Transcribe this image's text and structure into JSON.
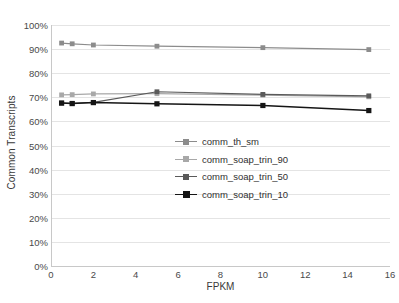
{
  "chart_data": {
    "type": "line",
    "title": "",
    "xlabel": "FPKM",
    "ylabel": "Common Transcripts",
    "xlim": [
      0,
      16
    ],
    "ylim": [
      0,
      100
    ],
    "grid": true,
    "legend_position": "center-inside",
    "x": [
      0.5,
      1,
      2,
      5,
      10,
      15
    ],
    "xticks": [
      "0",
      "2",
      "4",
      "6",
      "8",
      "10",
      "12",
      "14",
      "16"
    ],
    "xtick_values": [
      0,
      2,
      4,
      6,
      8,
      10,
      12,
      14,
      16
    ],
    "yticks": [
      "0%",
      "10%",
      "20%",
      "30%",
      "40%",
      "50%",
      "60%",
      "70%",
      "80%",
      "90%",
      "100%"
    ],
    "ytick_values": [
      0,
      10,
      20,
      30,
      40,
      50,
      60,
      70,
      80,
      90,
      100
    ],
    "series": [
      {
        "name": "comm_th_sm",
        "color": "#8c8c8c",
        "marker": "square",
        "values": [
          92.5,
          92.2,
          91.7,
          91.2,
          90.6,
          89.8
        ]
      },
      {
        "name": "comm_soap_trin_90",
        "color": "#a8a8a8",
        "marker": "square",
        "values": [
          71.0,
          71.1,
          71.4,
          71.5,
          70.9,
          70.2
        ]
      },
      {
        "name": "comm_soap_trin_50",
        "color": "#5a5a5a",
        "marker": "square",
        "values": [
          67.6,
          67.5,
          67.9,
          72.3,
          71.2,
          70.6
        ]
      },
      {
        "name": "comm_soap_trin_10",
        "color": "#151515",
        "marker": "square",
        "values": [
          67.6,
          67.4,
          67.8,
          67.3,
          66.6,
          64.5
        ]
      }
    ]
  }
}
